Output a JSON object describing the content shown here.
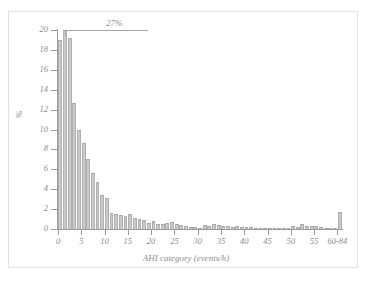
{
  "chart_data": {
    "type": "bar",
    "title": "",
    "subtitle": "",
    "xlabel": "AHI category (events/h)",
    "ylabel": "%",
    "xlim": [
      0,
      61
    ],
    "ylim": [
      0,
      20
    ],
    "ytick_labels": [
      "0",
      "2",
      "4",
      "6",
      "8",
      "10",
      "12",
      "14",
      "16",
      "18",
      "20"
    ],
    "ytick_values": [
      0,
      2,
      4,
      6,
      8,
      10,
      12,
      14,
      16,
      18,
      20
    ],
    "xtick_labels": [
      "0",
      "5",
      "10",
      "15",
      "20",
      "25",
      "30",
      "35",
      "40",
      "45",
      "50",
      "55",
      "60-84"
    ],
    "xtick_values": [
      0,
      5,
      10,
      15,
      20,
      25,
      30,
      35,
      40,
      45,
      50,
      55,
      60
    ],
    "grid": false,
    "legend": null,
    "bar_color": "#c9c9c9",
    "bar_edge_color": "#a8a8a8",
    "axis_color": "#9a9a9a",
    "text_color": "#8d8d8d",
    "frame_color": "#e2e2e2",
    "annotations": [
      {
        "text": "27%",
        "x": 1,
        "y": 27,
        "note": "tallest bar is clipped by the y-axis maximum of 20; leader line points to its top"
      }
    ],
    "categories": [
      0,
      1,
      2,
      3,
      4,
      5,
      6,
      7,
      8,
      9,
      10,
      11,
      12,
      13,
      14,
      15,
      16,
      17,
      18,
      19,
      20,
      21,
      22,
      23,
      24,
      25,
      26,
      27,
      28,
      29,
      30,
      31,
      32,
      33,
      34,
      35,
      36,
      37,
      38,
      39,
      40,
      41,
      42,
      43,
      44,
      45,
      46,
      47,
      48,
      49,
      50,
      51,
      52,
      53,
      54,
      55,
      56,
      57,
      58,
      59,
      60
    ],
    "values": [
      19.0,
      27.0,
      19.2,
      12.7,
      10.0,
      8.6,
      7.0,
      5.6,
      4.7,
      3.4,
      3.1,
      1.6,
      1.5,
      1.4,
      1.3,
      1.5,
      1.1,
      1.0,
      0.9,
      0.6,
      0.8,
      0.5,
      0.5,
      0.6,
      0.7,
      0.5,
      0.4,
      0.3,
      0.2,
      0.2,
      0.15,
      0.4,
      0.35,
      0.5,
      0.4,
      0.3,
      0.3,
      0.25,
      0.3,
      0.25,
      0.2,
      0.2,
      0.15,
      0.15,
      0.1,
      0.1,
      0.1,
      0.1,
      0.08,
      0.1,
      0.3,
      0.2,
      0.5,
      0.3,
      0.3,
      0.3,
      0.2,
      0.15,
      0.1,
      0.1,
      1.7
    ]
  }
}
